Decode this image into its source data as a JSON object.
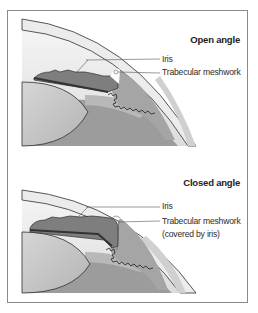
{
  "figure": {
    "panels": [
      {
        "title": "Open angle",
        "labels": {
          "iris": "Iris",
          "trabecular": "Trabecular meshwork",
          "trabecular_note": ""
        }
      },
      {
        "title": "Closed angle",
        "labels": {
          "iris": "Iris",
          "trabecular": "Trabecular meshwork",
          "trabecular_note": "(covered by iris)"
        }
      }
    ],
    "colors": {
      "frame_border": "#8a8a8a",
      "cornea_fill": "#e6e6e6",
      "iris_fill": "#7d7d7d",
      "iris_edge": "#3a3a3a",
      "lens_fill": "#c8c8c8",
      "vitreous_fill": "#9a9a9a",
      "ciliary_fill": "#a8a8a8",
      "leader_line": "#555555"
    }
  }
}
